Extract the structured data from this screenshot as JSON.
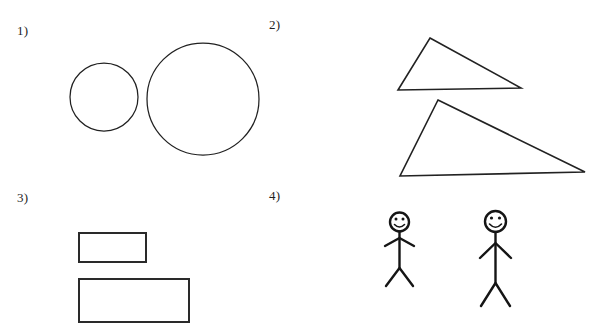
{
  "page": {
    "background_color": "#ffffff",
    "ink_color": "#151515",
    "width": 603,
    "height": 331
  },
  "panels": [
    {
      "label": "1)",
      "name": "panel-circles",
      "content_type": "circles",
      "shapes": [
        {
          "name": "small-circle",
          "cx": 104,
          "cy": 97,
          "r": 34,
          "size": "small"
        },
        {
          "name": "large-circle",
          "cx": 203,
          "cy": 99,
          "r": 56,
          "size": "large"
        }
      ]
    },
    {
      "label": "2)",
      "name": "panel-triangles",
      "content_type": "triangles",
      "shapes": [
        {
          "name": "small-triangle",
          "points": "430,38 521,88 398,90",
          "size": "small"
        },
        {
          "name": "large-triangle",
          "points": "438,100 585,172 400,176",
          "size": "large"
        }
      ]
    },
    {
      "label": "3)",
      "name": "panel-rectangles",
      "content_type": "rectangles",
      "shapes": [
        {
          "name": "small-rectangle",
          "x": 79,
          "y": 233,
          "w": 67,
          "h": 29,
          "size": "small"
        },
        {
          "name": "large-rectangle",
          "x": 79,
          "y": 279,
          "w": 110,
          "h": 43,
          "size": "large"
        }
      ]
    },
    {
      "label": "4)",
      "name": "panel-stick-figures",
      "content_type": "stick-figures",
      "shapes": [
        {
          "name": "short-stick-figure",
          "size": "small",
          "head": {
            "cx": 399.5,
            "cy": 222,
            "r": 9.5
          },
          "body": "399.5,231.5 399.5,268",
          "arms": "385,246 399.5,238 414,246",
          "legs": "386,286 399.5,268 413,286",
          "face": {
            "eye_left": {
              "cx": 396,
              "cy": 219,
              "r": 1.5
            },
            "eye_right": {
              "cx": 403,
              "cy": 219,
              "r": 1.5
            },
            "smile": "M 394.5 224.5 Q 399.5 229.5 404.5 224.5"
          }
        },
        {
          "name": "tall-stick-figure",
          "size": "large",
          "head": {
            "cx": 495.5,
            "cy": 221.5,
            "r": 10.5
          },
          "body": "495.5,232 495.5,283",
          "arms": "480,258 495.5,243 511,258",
          "legs": "481,306 495.5,283 510,306",
          "face": {
            "eye_left": {
              "cx": 491.5,
              "cy": 218,
              "r": 1.6
            },
            "eye_right": {
              "cx": 499.5,
              "cy": 218,
              "r": 1.6
            },
            "smile": "M 489.5 224 Q 495.5 230.5 501.5 224"
          }
        }
      ]
    }
  ]
}
